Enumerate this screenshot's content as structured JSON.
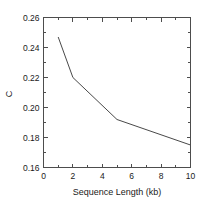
{
  "chart_data": {
    "type": "line",
    "title": "",
    "xlabel": "Sequence Length (kb)",
    "ylabel": "C",
    "xlim": [
      0,
      10
    ],
    "ylim": [
      0.16,
      0.26
    ],
    "grid": false,
    "legend": null,
    "x_ticks": [
      0,
      2,
      4,
      6,
      8,
      10
    ],
    "x_tick_labels": [
      "0",
      "2",
      "4",
      "6",
      "8",
      "10"
    ],
    "x_minor_ticks": [
      1,
      3,
      5,
      7,
      9
    ],
    "y_ticks": [
      0.16,
      0.18,
      0.2,
      0.22,
      0.24,
      0.26
    ],
    "y_tick_labels": [
      "0.16",
      "0.18",
      "0.20",
      "0.22",
      "0.24",
      "0.26"
    ],
    "y_minor_ticks": [
      0.17,
      0.19,
      0.21,
      0.23,
      0.25
    ],
    "series": [
      {
        "name": "C",
        "x": [
          1,
          2,
          5,
          10
        ],
        "values": [
          0.247,
          0.22,
          0.192,
          0.175
        ],
        "color": "#333333",
        "marker": "none"
      }
    ]
  },
  "axis": {
    "frame_color": "#4d4d4d",
    "background": "#ffffff"
  }
}
